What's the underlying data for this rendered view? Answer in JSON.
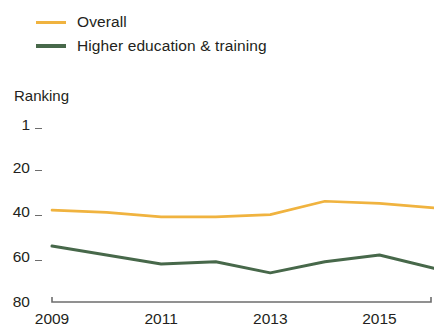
{
  "legend": {
    "items": [
      {
        "label": "Overall",
        "color": "#F0B33F",
        "key": "overall"
      },
      {
        "label": "Higher education & training",
        "color": "#47684A",
        "key": "higher_education"
      }
    ]
  },
  "axis": {
    "y_title": "Ranking",
    "y_ticks": [
      "1",
      "20",
      "40",
      "60",
      "80"
    ],
    "x_ticks": [
      "2009",
      "2011",
      "2013",
      "2015"
    ]
  },
  "colors": {
    "overall": "#F0B33F",
    "higher_education": "#47684A",
    "axis": "#6d6d6d",
    "text": "#231f20",
    "background": "#ffffff"
  },
  "chart_data": {
    "type": "line",
    "title": "",
    "subtitle": "",
    "xlabel": "",
    "ylabel": "Ranking",
    "x": [
      2009,
      2010,
      2011,
      2012,
      2013,
      2014,
      2015,
      2016
    ],
    "xlim": [
      2009,
      2016
    ],
    "ylim": [
      1,
      80
    ],
    "y_inverted": true,
    "y_ticks": [
      1,
      20,
      40,
      60,
      80
    ],
    "x_ticks": [
      2009,
      2011,
      2013,
      2015
    ],
    "grid": false,
    "legend_position": "top-left",
    "series": [
      {
        "name": "Overall",
        "color": "#F0B33F",
        "values": [
          39,
          40,
          42,
          42,
          41,
          35,
          36,
          38
        ]
      },
      {
        "name": "Higher education & training",
        "color": "#47684A",
        "values": [
          55,
          59,
          63,
          62,
          67,
          62,
          59,
          65
        ]
      }
    ]
  }
}
